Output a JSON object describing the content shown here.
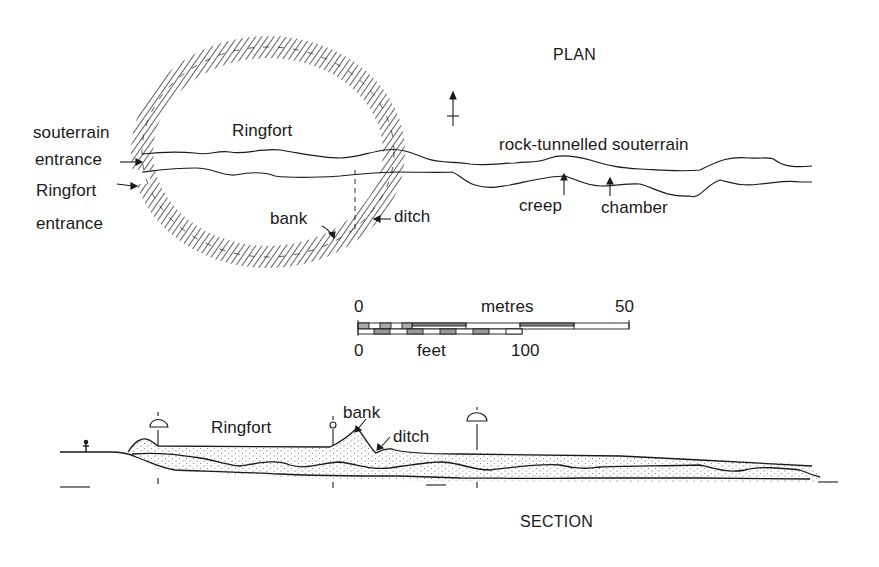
{
  "plan": {
    "title": "PLAN",
    "labels": {
      "souterrain_entrance_line1": "souterrain",
      "souterrain_entrance_line2": "entrance",
      "ringfort_entrance_line1": "Ringfort",
      "ringfort_entrance_line2": "entrance",
      "ringfort": "Ringfort",
      "bank": "bank",
      "ditch": "ditch",
      "rock_tunnelled_souterrain": "rock-tunnelled souterrain",
      "creep": "creep",
      "chamber": "chamber"
    },
    "north_arrow": "north-arrow"
  },
  "scale_bar": {
    "metres_start": "0",
    "metres_label": "metres",
    "metres_end": "50",
    "feet_start": "0",
    "feet_label": "feet",
    "feet_end": "100"
  },
  "section": {
    "title": "SECTION",
    "labels": {
      "ringfort": "Ringfort",
      "bank": "bank",
      "ditch": "ditch"
    }
  },
  "colors": {
    "ink": "#1a1a1a",
    "background": "#ffffff",
    "stipple": "#555555"
  }
}
